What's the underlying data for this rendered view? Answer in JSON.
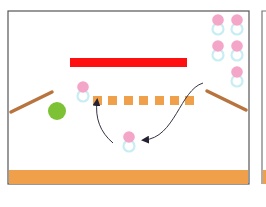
{
  "diagram": {
    "colors": {
      "frame": "#555555",
      "floor": "#f0a04a",
      "floor_edge": "#7a4a20",
      "red_bar": "#ff1010",
      "block": "#f0a04a",
      "ramp": "#b8743e",
      "ball": "#7cc234",
      "token_head": "#f4a6c8",
      "token_body": "#c8eef4",
      "arrow": "#333344"
    },
    "main_frame": {
      "x": 8,
      "y": 11,
      "w": 241,
      "h": 173
    },
    "next_frame": {
      "x": 262,
      "y": 11
    },
    "floor": {
      "x": 9,
      "y": 170,
      "w": 239,
      "h": 14
    },
    "red_bar": {
      "x": 70,
      "y": 58,
      "w": 117,
      "h": 9
    },
    "blocks": [
      {
        "x": 93,
        "y": 96
      },
      {
        "x": 108,
        "y": 96
      },
      {
        "x": 124,
        "y": 96
      },
      {
        "x": 139,
        "y": 96
      },
      {
        "x": 155,
        "y": 96
      },
      {
        "x": 170,
        "y": 96
      },
      {
        "x": 185,
        "y": 96
      }
    ],
    "block_size": 9,
    "ramps": [
      {
        "name": "left-ramp",
        "x1": 11,
        "y1": 112,
        "x2": 52,
        "y2": 92
      },
      {
        "name": "right-ramp",
        "x1": 207,
        "y1": 91,
        "x2": 246,
        "y2": 110
      }
    ],
    "ball": {
      "cx": 57,
      "cy": 111,
      "r": 9
    },
    "tokens": [
      {
        "name": "token-stack-1",
        "cx": 218,
        "cy": 20
      },
      {
        "name": "token-stack-2",
        "cx": 237,
        "cy": 20
      },
      {
        "name": "token-stack-3",
        "cx": 218,
        "cy": 46
      },
      {
        "name": "token-stack-4",
        "cx": 237,
        "cy": 46
      },
      {
        "name": "token-stack-5",
        "cx": 237,
        "cy": 72
      },
      {
        "name": "token-on-row",
        "cx": 83,
        "cy": 87
      },
      {
        "name": "token-floating",
        "cx": 129,
        "cy": 137
      }
    ],
    "arrows": [
      {
        "name": "arrow-up-to-block",
        "path": "M 113 143 C 100 132, 95 118, 97 101"
      },
      {
        "name": "arrow-to-token",
        "path": "M 203 83 C 180 90, 175 138, 144 140"
      }
    ]
  }
}
